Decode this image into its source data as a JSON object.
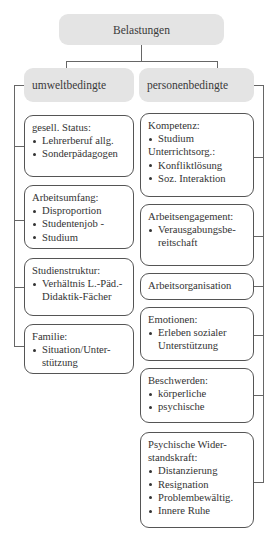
{
  "root": {
    "label": "Belastungen"
  },
  "categories": [
    {
      "label": "umweltbedingte",
      "items": [
        {
          "title": "gesell. Status:",
          "bullets": [
            "Lehrerberuf allg.",
            "Sonderpädagogen"
          ]
        },
        {
          "title": "Arbeitsumfang:",
          "bullets": [
            "Disproportion",
            "Studentenjob -",
            "Studium"
          ]
        },
        {
          "title": "Studienstruktur:",
          "bullets": [
            "Verhältnis L.-Päd.- Didaktik-Fächer"
          ]
        },
        {
          "title": "Familie:",
          "bullets": [
            "Situation/Unter- stützung"
          ]
        }
      ]
    },
    {
      "label": "personenbedingte",
      "items": [
        {
          "title": "Kompetenz:",
          "bullets": [
            "Studium"
          ],
          "title2": "Unterrichtsorg.:",
          "bullets2": [
            "Konfliktlösung",
            "Soz. Interaktion"
          ]
        },
        {
          "title": "Arbeitsengagement:",
          "bullets": [
            "Verausgabungsbe- reitschaft"
          ]
        },
        {
          "title": "Arbeitsorganisation",
          "bullets": []
        },
        {
          "title": "Emotionen:",
          "bullets": [
            "Erleben sozialer Unterstützung"
          ]
        },
        {
          "title": "Beschwerden:",
          "bullets": [
            "körperliche",
            "psychische"
          ]
        },
        {
          "title": "Psychische Wider- standskraft:",
          "bullets": [
            "Distanzierung",
            "Resignation",
            "Problembewältig.",
            "Innere Ruhe"
          ]
        }
      ]
    }
  ],
  "colors": {
    "header_fill": "#e4e4e4",
    "line": "#666666",
    "border": "#555555"
  }
}
